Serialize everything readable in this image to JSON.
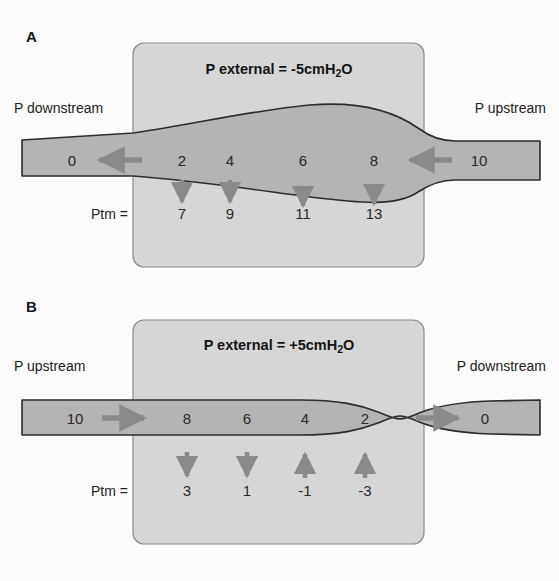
{
  "figure": {
    "background_color": "#fbfbfb",
    "box_fill": "#d6d6d6",
    "box_stroke": "#8c8c8c",
    "airway_fill": "#b4b4b4",
    "airway_stroke": "#2d2d2d",
    "arrow_color": "#8a8a8a",
    "text_color": "#232323"
  },
  "panels": [
    {
      "letter": "A",
      "external_pressure": {
        "prefix": "P external = -5cmH",
        "subscript": "2",
        "suffix": "O",
        "full_text": "P external = -5cmH2O",
        "value": -5,
        "unit": "cmH2O"
      },
      "left_label": "P downstream",
      "right_label": "P upstream",
      "flow_direction": "right-to-left",
      "ptm_label": "Ptm =",
      "airway_pressures": [
        {
          "value": "0",
          "x": 72
        },
        {
          "value": "2",
          "x": 182
        },
        {
          "value": "4",
          "x": 230
        },
        {
          "value": "6",
          "x": 303
        },
        {
          "value": "8",
          "x": 374
        },
        {
          "value": "10",
          "x": 479
        }
      ],
      "flow_arrows": [
        {
          "direction": "left",
          "x": 120
        },
        {
          "direction": "left",
          "x": 428
        }
      ],
      "ptm_entries": [
        {
          "value": "7",
          "x": 182,
          "arrow": "down"
        },
        {
          "value": "9",
          "x": 230,
          "arrow": "down"
        },
        {
          "value": "11",
          "x": 303,
          "arrow": "down"
        },
        {
          "value": "13",
          "x": 374,
          "arrow": "down"
        }
      ]
    },
    {
      "letter": "B",
      "external_pressure": {
        "prefix": "P external = +5cmH",
        "subscript": "2",
        "suffix": "O",
        "full_text": "P external = +5cmH2O",
        "value": 5,
        "unit": "cmH2O"
      },
      "left_label": "P upstream",
      "right_label": "P downstream",
      "flow_direction": "left-to-right",
      "ptm_label": "Ptm =",
      "airway_pressures": [
        {
          "value": "10",
          "x": 75
        },
        {
          "value": "8",
          "x": 187
        },
        {
          "value": "6",
          "x": 247
        },
        {
          "value": "4",
          "x": 305
        },
        {
          "value": "2",
          "x": 365
        },
        {
          "value": "0",
          "x": 485
        }
      ],
      "flow_arrows": [
        {
          "direction": "right",
          "x": 124
        },
        {
          "direction": "right",
          "x": 437
        }
      ],
      "ptm_entries": [
        {
          "value": "3",
          "x": 187,
          "arrow": "down"
        },
        {
          "value": "1",
          "x": 247,
          "arrow": "down"
        },
        {
          "value": "-1",
          "x": 305,
          "arrow": "up"
        },
        {
          "value": "-3",
          "x": 365,
          "arrow": "up"
        }
      ]
    }
  ]
}
